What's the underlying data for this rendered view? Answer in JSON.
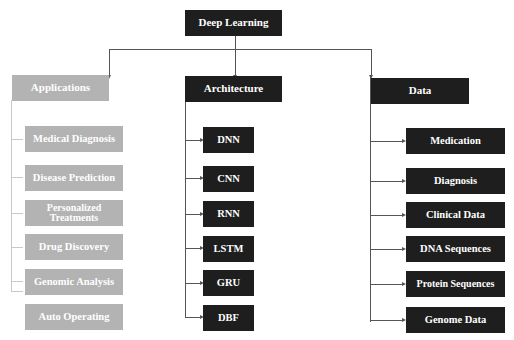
{
  "diagram": {
    "root": {
      "label": "Deep Learning"
    },
    "columns": [
      {
        "id": "applications",
        "label": "Applications",
        "style": "gray",
        "children": [
          "Medical Diagnosis",
          "Disease Prediction",
          "Personalized Treatments",
          "Drug Discovery",
          "Genomic Analysis",
          "Auto Operating"
        ]
      },
      {
        "id": "architecture",
        "label": "Architecture",
        "style": "dark",
        "children": [
          "DNN",
          "CNN",
          "RNN",
          "LSTM",
          "GRU",
          "DBF"
        ]
      },
      {
        "id": "data",
        "label": "Data",
        "style": "dark",
        "children": [
          "Medication",
          "Diagnosis",
          "Clinical Data",
          "DNA Sequences",
          "Protein Sequences",
          "Genome Data"
        ]
      }
    ]
  },
  "colors": {
    "dark_box": "#1e1e1e",
    "gray_box": "#b3b3b3",
    "connector": "#555555",
    "text": "#ffffff"
  }
}
